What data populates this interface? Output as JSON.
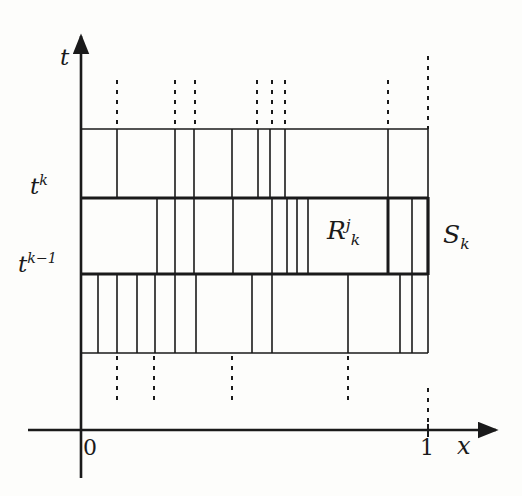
{
  "figure": {
    "kind": "mathematical-diagram",
    "background_color": "#fdfdfb",
    "line_color": "#1a1a1a"
  },
  "axes": {
    "x_axis": {
      "label": "x",
      "y_pixel": 430,
      "x_start": 28,
      "x_end": 500,
      "arrow": true
    },
    "y_axis": {
      "label": "t",
      "x_pixel": 81,
      "y_start": 478,
      "y_end": 30,
      "arrow": true
    },
    "ticks": [
      {
        "name": "origin",
        "text": "0",
        "x": 81
      },
      {
        "name": "unit",
        "text": "1",
        "x": 428
      }
    ],
    "y_ticks": [
      {
        "name": "t-k",
        "text_base": "t",
        "sup": "k",
        "y": 198
      },
      {
        "name": "t-k-minus-1",
        "text_base": "t",
        "sup": "k−1",
        "y": 274
      }
    ]
  },
  "labels": {
    "t_axis": "t",
    "x_axis": "x",
    "t_k": {
      "base": "t",
      "sup": "k"
    },
    "t_k_minus_1": {
      "base": "t",
      "sup": "k−1"
    },
    "region": {
      "base": "R",
      "sup": "j",
      "sub": "k"
    },
    "strip": {
      "base": "S",
      "sub": "k"
    },
    "origin": "0",
    "unit": "1"
  },
  "geometry": {
    "domain_left": 81,
    "domain_right": 428,
    "band_lines_y": [
      129,
      198,
      274,
      353
    ],
    "bands": [
      {
        "name": "upper-band",
        "y_top": 129,
        "y_bottom": 198,
        "dividers_x": [
          117,
          175,
          194,
          232,
          258,
          270,
          285,
          388
        ]
      },
      {
        "name": "strip-band-Sk",
        "y_top": 198,
        "y_bottom": 274,
        "emphasized": true,
        "dividers_x": [
          157,
          175,
          194,
          233,
          272,
          287,
          297,
          308,
          388,
          412
        ]
      },
      {
        "name": "lower-band",
        "y_top": 274,
        "y_bottom": 353,
        "dividers_x": [
          98,
          117,
          137,
          155,
          175,
          196,
          252,
          272,
          348,
          400,
          412
        ]
      }
    ],
    "dashed_above": {
      "y_top": 80,
      "y_bottom": 129,
      "x_values": [
        117,
        175,
        195,
        257,
        272,
        285,
        388
      ]
    },
    "dashed_below": {
      "y_top": 353,
      "y_bottom": 400,
      "x_values": [
        117,
        154,
        232,
        348
      ]
    },
    "right_boundary_dashed_segments": [
      {
        "name": "top-dash",
        "x": 428,
        "y_top": 56,
        "y_bottom": 129
      },
      {
        "name": "bottom-dash",
        "x": 428,
        "y_top": 390,
        "y_bottom": 430
      }
    ]
  }
}
